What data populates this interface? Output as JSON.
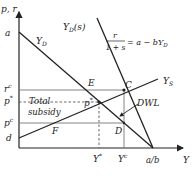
{
  "diagram": {
    "axes": {
      "y_label": "p, r",
      "x_label": "Y"
    },
    "y_ticks": {
      "a": "a",
      "rc": "r",
      "rc_sup": "c",
      "pstar": "p",
      "pstar_sup": "*",
      "pc": "p",
      "pc_sup": "c",
      "d": "d"
    },
    "x_ticks": {
      "ystar": "Y",
      "ystar_sup": "*",
      "yc": "Y",
      "yc_sup": "c",
      "ab": "a/b"
    },
    "curves": {
      "yd": "Y",
      "yd_sub": "D",
      "yds": "Y",
      "yds_sub": "D",
      "yds_arg": "(s)",
      "ys": "Y",
      "ys_sub": "S"
    },
    "equation": {
      "numerator": "r",
      "denominator": "1 + s",
      "rhs": "= a − bY",
      "rhs_sub": "D"
    },
    "points": {
      "E": "E",
      "C": "C",
      "pstar": "p",
      "pstar_sup": "*",
      "F": "F",
      "D": "D"
    },
    "annotations": {
      "total_subsidy_line1": "Total",
      "total_subsidy_line2": "subsidy",
      "dwl": "DWL"
    }
  }
}
